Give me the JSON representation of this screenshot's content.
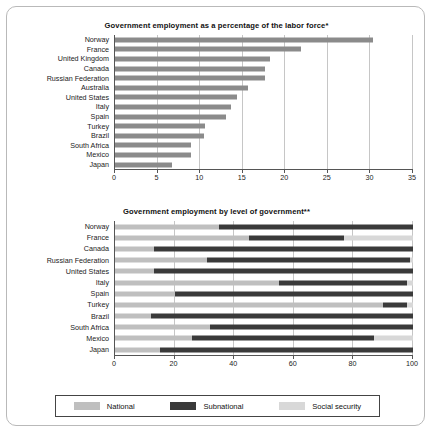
{
  "colors": {
    "national": "#bfbfbf",
    "subnational": "#3a3a3a",
    "social_security": "#d8d8d8",
    "single_bar": "#8b8b8b",
    "axis": "#555555",
    "grid": "#c6c6c6"
  },
  "legend": {
    "items": [
      {
        "label": "National",
        "color_key": "national"
      },
      {
        "label": "Subnational",
        "color_key": "subnational"
      },
      {
        "label": "Social security",
        "color_key": "social_security"
      }
    ]
  },
  "footnote": "*Data are 2011 or the most recent year available. **Data are for the latest available year. Source: ILO, 2013; national, 2011.",
  "chart_data": [
    {
      "type": "bar",
      "title": "Government employment as a percentage of the labor force*",
      "orientation": "horizontal",
      "xlabel": "",
      "ylabel": "",
      "xlim": [
        0,
        35
      ],
      "xticks": [
        0,
        5,
        10,
        15,
        20,
        25,
        30,
        35
      ],
      "grid": true,
      "legend_position": "none",
      "categories": [
        "Norway",
        "France",
        "United Kingdom",
        "Canada",
        "Russian Federation",
        "Australia",
        "United States",
        "Italy",
        "Spain",
        "Turkey",
        "Brazil",
        "South Africa",
        "Mexico",
        "Japan"
      ],
      "values": [
        30.3,
        21.9,
        18.2,
        17.6,
        17.6,
        15.6,
        14.3,
        13.6,
        13.0,
        10.6,
        10.5,
        8.9,
        8.9,
        6.7
      ]
    },
    {
      "type": "bar",
      "subtype": "stacked-100",
      "title": "Government employment by level of government**",
      "orientation": "horizontal",
      "xlabel": "",
      "ylabel": "",
      "xlim": [
        0,
        100
      ],
      "xticks": [
        0,
        20,
        40,
        60,
        80,
        100
      ],
      "grid": true,
      "legend_position": "bottom",
      "categories": [
        "Norway",
        "France",
        "Canada",
        "Russian Federation",
        "United States",
        "Italy",
        "Spain",
        "Turkey",
        "Brazil",
        "South Africa",
        "Mexico",
        "Japan"
      ],
      "series": [
        {
          "name": "National",
          "color_key": "national",
          "values": [
            35,
            45,
            13,
            31,
            13,
            55,
            20,
            90,
            12,
            32,
            26,
            15
          ]
        },
        {
          "name": "Subnational",
          "color_key": "subnational",
          "values": [
            65,
            32,
            87,
            68,
            87,
            43,
            80,
            8,
            88,
            68,
            61,
            85
          ]
        },
        {
          "name": "Social security",
          "color_key": "social_security",
          "values": [
            0,
            23,
            0,
            1,
            0,
            2,
            0,
            2,
            0,
            0,
            13,
            0
          ]
        }
      ]
    }
  ]
}
